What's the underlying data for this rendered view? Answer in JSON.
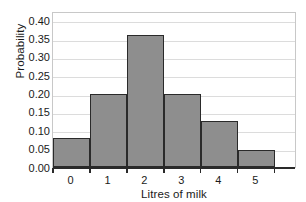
{
  "chart_data": {
    "type": "bar",
    "title": "",
    "subtitle": "",
    "xlabel": "Litres of milk",
    "ylabel": "Probability",
    "categories": [
      "0",
      "1",
      "2",
      "3",
      "4",
      "5"
    ],
    "values": [
      0.08,
      0.2,
      0.36,
      0.2,
      0.125,
      0.045
    ],
    "series": [
      {
        "name": "Probability",
        "values": [
          0.08,
          0.2,
          0.36,
          0.2,
          0.125,
          0.045
        ]
      }
    ],
    "ylim": [
      0.0,
      0.425
    ],
    "xlim": [
      0,
      6.6
    ],
    "y_ticks": [
      0.0,
      0.05,
      0.1,
      0.15,
      0.2,
      0.25,
      0.3,
      0.35,
      0.4
    ],
    "y_tick_labels": [
      "0.00",
      "0.05",
      "0.10",
      "0.15",
      "0.20",
      "0.25",
      "0.30",
      "0.35",
      "0.40"
    ],
    "x_tick_labels": [
      "0",
      "1",
      "2",
      "3",
      "4",
      "5"
    ],
    "grid": "horizontal",
    "legend": "none",
    "annotations": [],
    "colors": {
      "bar_fill": "#8e8e8e",
      "bar_edge": "#2a2a2a",
      "gridline": "#dcdcdc",
      "axis_line": "#2a2a2a",
      "plot_border": "#c8c8c8",
      "text": "#1a1a1a",
      "background": "#ffffff"
    }
  }
}
